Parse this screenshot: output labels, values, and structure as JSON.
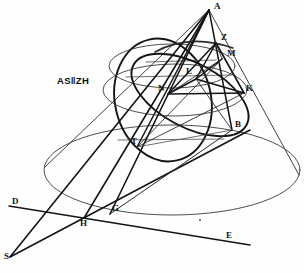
{
  "figure": {
    "canvas": {
      "width": 304,
      "height": 273
    },
    "ink_color": "#1a1a1a",
    "background_color": "#fefefe",
    "annotation": {
      "text": "AS‖ZH",
      "meaning": "AS parallel to ZH",
      "x": 57,
      "y": 76
    },
    "points": [
      {
        "id": "A",
        "label": "A",
        "x": 209,
        "y": 10,
        "label_x": 214,
        "label_y": 2,
        "role": "cone-apex"
      },
      {
        "id": "Z",
        "label": "Z",
        "x": 216,
        "y": 43,
        "label_x": 221,
        "label_y": 33,
        "role": "sphere-tangent-point"
      },
      {
        "id": "M",
        "label": "M",
        "x": 222,
        "y": 59,
        "label_x": 227,
        "label_y": 49,
        "role": "conic-point"
      },
      {
        "id": "L",
        "label": "L",
        "x": 196,
        "y": 79,
        "label_x": 186,
        "label_y": 67,
        "role": "conic-center"
      },
      {
        "id": "N",
        "label": "N",
        "x": 168,
        "y": 94,
        "label_x": 158,
        "label_y": 84,
        "role": "conic-point"
      },
      {
        "id": "K",
        "label": "K",
        "x": 244,
        "y": 93,
        "label_x": 246,
        "label_y": 84,
        "role": "conic-point"
      },
      {
        "id": "B",
        "label": "B",
        "x": 232,
        "y": 130,
        "label_x": 235,
        "label_y": 120,
        "role": "base-circle-point"
      },
      {
        "id": "T",
        "label": "T",
        "x": 137,
        "y": 147,
        "label_x": 131,
        "label_y": 137,
        "role": "conic-vertex"
      },
      {
        "id": "G",
        "label": "G",
        "x": 110,
        "y": 214,
        "label_x": 112,
        "label_y": 204,
        "role": "directrix-intersection"
      },
      {
        "id": "H",
        "label": "H",
        "x": 84,
        "y": 218,
        "label_x": 80,
        "label_y": 219,
        "role": "directrix-intersection"
      },
      {
        "id": "S",
        "label": "S",
        "x": 10,
        "y": 257,
        "label_x": 4,
        "label_y": 252,
        "role": "axis-foot"
      },
      {
        "id": "D",
        "label": "D",
        "x": 9,
        "y": 206,
        "label_x": 12,
        "label_y": 197,
        "role": "directrix-end-left"
      },
      {
        "id": "E",
        "label": "E",
        "x": 250,
        "y": 245,
        "label_x": 226,
        "label_y": 231,
        "role": "directrix-end-right"
      }
    ],
    "elements": [
      {
        "name": "base-ellipse",
        "type": "ellipse",
        "description": "base circle of the cone drawn in perspective"
      },
      {
        "name": "cone-left-generator",
        "type": "line",
        "from": "A",
        "to": "base-left"
      },
      {
        "name": "cone-right-generator",
        "type": "line",
        "from": "A",
        "to": "base-right"
      },
      {
        "name": "inscribed-sphere",
        "type": "ellipse",
        "description": "sphere inscribed in the cone"
      },
      {
        "name": "sphere-contact-circle",
        "type": "ellipse",
        "description": "circle where sphere touches the cone"
      },
      {
        "name": "cutting-plane-ellipse",
        "type": "ellipse",
        "description": "conic section ellipse through T, K, M, N"
      },
      {
        "name": "line-ab",
        "type": "line",
        "from": "A",
        "to": "B"
      },
      {
        "name": "line-at",
        "type": "line",
        "from": "A",
        "to": "T"
      },
      {
        "name": "line-ag",
        "type": "line",
        "from": "A",
        "to": "G"
      },
      {
        "name": "line-ah",
        "type": "line",
        "from": "A",
        "to": "H"
      },
      {
        "name": "line-as",
        "type": "line",
        "from": "A",
        "to": "S"
      },
      {
        "name": "line-de",
        "type": "line",
        "from": "D",
        "to": "E",
        "description": "directrix line"
      },
      {
        "name": "line-sh-g",
        "type": "line",
        "from": "S",
        "to": "B",
        "description": "secant through H and G"
      },
      {
        "name": "line-nk",
        "type": "line",
        "from": "N",
        "to": "K"
      },
      {
        "name": "line-zk",
        "type": "line",
        "from": "Z",
        "to": "K"
      },
      {
        "name": "line-zn",
        "type": "line",
        "from": "Z",
        "to": "N"
      },
      {
        "name": "line-lm",
        "type": "line",
        "from": "L",
        "to": "M"
      },
      {
        "name": "line-tm",
        "type": "line",
        "from": "T",
        "to": "M"
      }
    ]
  }
}
